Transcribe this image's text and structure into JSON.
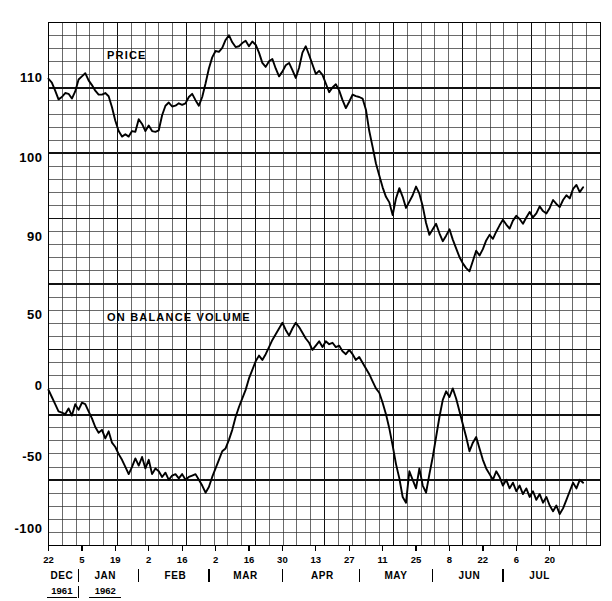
{
  "figure": {
    "background": "#ffffff",
    "ink": "#000000",
    "width": 612,
    "height": 601
  },
  "chart_data": {
    "type": "line",
    "title": "",
    "subtitle": "",
    "xlabel": "",
    "grid": true,
    "legend_position": "inline-annotation",
    "panels": [
      {
        "name": "price",
        "annotation": "PRICE",
        "ylabel": "",
        "ylim": [
          84,
          117
        ],
        "yticks": [
          90,
          100,
          110
        ],
        "yticklabels": [
          "90",
          "100",
          "110"
        ],
        "series": [
          {
            "name": "PRICE",
            "values": [
              109.9,
              109.4,
              108.4,
              107.3,
              107.6,
              108.1,
              108.0,
              107.4,
              108.3,
              109.8,
              110.2,
              110.6,
              109.7,
              109.1,
              108.4,
              107.9,
              107.9,
              108.1,
              107.7,
              106.3,
              104.6,
              103.3,
              102.6,
              102.9,
              102.6,
              103.3,
              103.2,
              104.8,
              104.2,
              103.3,
              104.0,
              103.3,
              103.2,
              103.4,
              105.3,
              106.5,
              106.9,
              106.4,
              106.5,
              106.8,
              106.6,
              106.8,
              107.6,
              108.0,
              107.2,
              106.5,
              107.6,
              109.3,
              111.2,
              112.6,
              113.4,
              113.3,
              113.8,
              114.8,
              115.4,
              114.5,
              113.9,
              114.0,
              114.4,
              114.7,
              114.0,
              114.6,
              114.2,
              113.2,
              111.9,
              111.4,
              112.1,
              112.4,
              111.2,
              110.2,
              110.8,
              111.6,
              111.9,
              111.0,
              110.0,
              111.3,
              113.2,
              114.0,
              112.9,
              111.7,
              110.5,
              110.9,
              110.4,
              109.3,
              108.2,
              108.8,
              109.2,
              108.4,
              107.2,
              106.2,
              107.0,
              107.9,
              107.7,
              107.6,
              107.4,
              106.0,
              103.3,
              101.3,
              99.2,
              97.7,
              96.2,
              95.0,
              94.3,
              92.7,
              94.8,
              96.1,
              95.0,
              93.6,
              94.4,
              95.2,
              96.3,
              95.4,
              93.8,
              91.7,
              90.2,
              90.9,
              91.6,
              90.4,
              89.4,
              90.1,
              90.9,
              89.6,
              88.5,
              87.4,
              86.6,
              86.0,
              85.6,
              86.9,
              88.2,
              87.6,
              88.4,
              89.5,
              90.2,
              89.7,
              90.6,
              91.4,
              92.1,
              91.5,
              91.0,
              92.0,
              92.6,
              92.2,
              91.6,
              92.4,
              93.1,
              92.4,
              92.9,
              93.8,
              93.2,
              92.9,
              93.6,
              94.6,
              94.1,
              93.7,
              94.6,
              95.2,
              94.8,
              96.0,
              96.5,
              95.6,
              96.2
            ]
          }
        ]
      },
      {
        "name": "on_balance_volume",
        "annotation": "ON  BALANCE  VOLUME",
        "ylabel": "",
        "ylim": [
          -112,
          62
        ],
        "yticks": [
          -100,
          -50,
          0,
          50
        ],
        "yticklabels": [
          "-100",
          "-50",
          "0",
          "50"
        ],
        "series": [
          {
            "name": "ON BALANCE VOLUME",
            "values": [
              -3,
              -8,
              -13,
              -18,
              -19,
              -20,
              -16,
              -21,
              -13,
              -17,
              -12,
              -13,
              -18,
              -23,
              -29,
              -33,
              -31,
              -37,
              -32,
              -40,
              -43,
              -48,
              -52,
              -57,
              -62,
              -57,
              -51,
              -56,
              -50,
              -58,
              -52,
              -62,
              -58,
              -60,
              -64,
              -61,
              -66,
              -63,
              -62,
              -65,
              -62,
              -66,
              -64,
              -63,
              -62,
              -66,
              -70,
              -75,
              -71,
              -64,
              -58,
              -52,
              -46,
              -44,
              -38,
              -31,
              -22,
              -15,
              -9,
              -3,
              5,
              11,
              17,
              21,
              18,
              22,
              27,
              32,
              36,
              40,
              44,
              39,
              35,
              40,
              44,
              41,
              37,
              33,
              30,
              25,
              28,
              31,
              27,
              31,
              29,
              30,
              27,
              28,
              24,
              22,
              25,
              22,
              18,
              20,
              16,
              12,
              8,
              3,
              -2,
              -5,
              -12,
              -20,
              -30,
              -42,
              -55,
              -65,
              -78,
              -82,
              -60,
              -66,
              -72,
              -58,
              -70,
              -75,
              -62,
              -50,
              -36,
              -22,
              -10,
              -4,
              -8,
              -2,
              -9,
              -18,
              -27,
              -36,
              -46,
              -40,
              -36,
              -44,
              -52,
              -58,
              -62,
              -66,
              -60,
              -64,
              -70,
              -66,
              -72,
              -68,
              -74,
              -70,
              -76,
              -72,
              -78,
              -74,
              -80,
              -76,
              -82,
              -78,
              -84,
              -88,
              -84,
              -90,
              -86,
              -80,
              -74,
              -68,
              -72,
              -66,
              -68
            ]
          }
        ]
      }
    ],
    "x_axis": {
      "tick_labels": [
        {
          "label": "22",
          "index": 0
        },
        {
          "label": "5",
          "index": 10
        },
        {
          "label": "19",
          "index": 20
        },
        {
          "label": "2",
          "index": 30
        },
        {
          "label": "16",
          "index": 40
        },
        {
          "label": "2",
          "index": 50
        },
        {
          "label": "16",
          "index": 60
        },
        {
          "label": "30",
          "index": 70
        },
        {
          "label": "13",
          "index": 80
        },
        {
          "label": "27",
          "index": 90
        },
        {
          "label": "11",
          "index": 100
        },
        {
          "label": "25",
          "index": 110
        },
        {
          "label": "8",
          "index": 120
        },
        {
          "label": "22",
          "index": 130
        },
        {
          "label": "6",
          "index": 140
        },
        {
          "label": "20",
          "index": 150
        }
      ],
      "months": [
        {
          "label": "DEC",
          "center_index": 4
        },
        {
          "label": "JAN",
          "center_index": 17
        },
        {
          "label": "FEB",
          "center_index": 38
        },
        {
          "label": "MAR",
          "center_index": 59
        },
        {
          "label": "APR",
          "center_index": 82
        },
        {
          "label": "MAY",
          "center_index": 104
        },
        {
          "label": "JUN",
          "center_index": 126
        },
        {
          "label": "JUL",
          "center_index": 147
        }
      ],
      "month_separators_index": [
        9,
        27,
        48,
        70,
        93,
        115,
        136
      ],
      "years": [
        {
          "label": "1961",
          "center_index": 4
        },
        {
          "label": "1962",
          "center_index": 17
        }
      ]
    }
  }
}
